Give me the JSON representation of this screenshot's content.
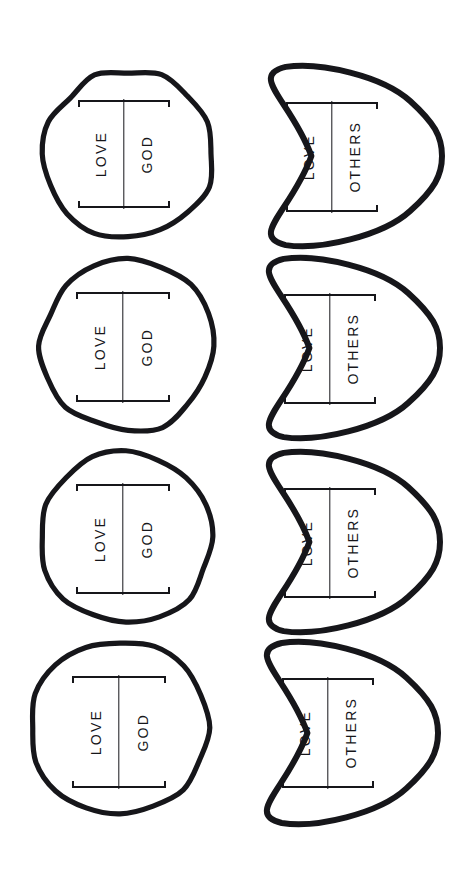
{
  "page": {
    "width": 462,
    "height": 877,
    "background": "#ffffff",
    "ink_color": "#16161a",
    "orientation_note": "sheet rotated 90 degrees; shapes and labels read sideways"
  },
  "columns": [
    {
      "name": "left-column",
      "shape": "circle",
      "label_line1": "LOVE",
      "label_line2": "GOD"
    },
    {
      "name": "right-column",
      "shape": "heart",
      "label_line1": "LOVE",
      "label_line2": "OTHERS"
    }
  ],
  "shapes": [
    {
      "id": "circle-1",
      "kind": "circle",
      "row": 1,
      "column": 1,
      "line1": "LOVE",
      "line2": "GOD",
      "x": 40,
      "y": 68,
      "w": 176,
      "h": 172,
      "label": {
        "x": 38,
        "y": 32,
        "w": 92,
        "h": 108
      }
    },
    {
      "id": "heart-1",
      "kind": "heart",
      "row": 1,
      "column": 2,
      "line1": "LOVE",
      "line2": "OTHERS",
      "x": 248,
      "y": 58,
      "w": 198,
      "h": 196,
      "label": {
        "x": 38,
        "y": 44,
        "w": 92,
        "h": 110
      }
    },
    {
      "id": "circle-2",
      "kind": "circle",
      "row": 2,
      "column": 1,
      "line1": "LOVE",
      "line2": "GOD",
      "x": 38,
      "y": 258,
      "w": 180,
      "h": 176,
      "label": {
        "x": 38,
        "y": 34,
        "w": 94,
        "h": 110
      }
    },
    {
      "id": "heart-2",
      "kind": "heart",
      "row": 2,
      "column": 2,
      "line1": "LOVE",
      "line2": "OTHERS",
      "x": 246,
      "y": 250,
      "w": 198,
      "h": 196,
      "label": {
        "x": 38,
        "y": 44,
        "w": 92,
        "h": 110
      }
    },
    {
      "id": "circle-3",
      "kind": "circle",
      "row": 3,
      "column": 1,
      "line1": "LOVE",
      "line2": "GOD",
      "x": 36,
      "y": 448,
      "w": 180,
      "h": 178,
      "label": {
        "x": 40,
        "y": 36,
        "w": 94,
        "h": 110
      }
    },
    {
      "id": "heart-3",
      "kind": "heart",
      "row": 3,
      "column": 2,
      "line1": "LOVE",
      "line2": "OTHERS",
      "x": 246,
      "y": 444,
      "w": 198,
      "h": 196,
      "label": {
        "x": 38,
        "y": 44,
        "w": 92,
        "h": 110
      }
    },
    {
      "id": "circle-4",
      "kind": "circle",
      "row": 4,
      "column": 1,
      "line1": "LOVE",
      "line2": "GOD",
      "x": 28,
      "y": 638,
      "w": 184,
      "h": 180,
      "label": {
        "x": 44,
        "y": 38,
        "w": 94,
        "h": 112
      }
    },
    {
      "id": "heart-4",
      "kind": "heart",
      "row": 4,
      "column": 2,
      "line1": "LOVE",
      "line2": "OTHERS",
      "x": 244,
      "y": 634,
      "w": 198,
      "h": 198,
      "label": {
        "x": 38,
        "y": 44,
        "w": 92,
        "h": 110
      }
    }
  ]
}
